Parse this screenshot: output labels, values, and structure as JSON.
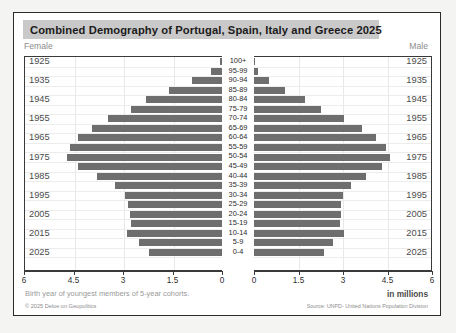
{
  "header": {
    "title": "Combined Demography of Portugal, Spain, Italy and Greece 2025",
    "female_label": "Female",
    "male_label": "Male"
  },
  "footer": {
    "note": "Birth year of youngest members of 5-year cohorts.",
    "units": "in millions",
    "copyright": "© 2025 Deloe on Geopolitics",
    "source": "Source: UNPD- United Nations Population Division"
  },
  "axis": {
    "left_ticks": [
      "6",
      "4.5",
      "3",
      "1.5",
      "0"
    ],
    "right_ticks": [
      "0",
      "1.5",
      "3",
      "4.5",
      "6"
    ],
    "max": 6
  },
  "chart_data": {
    "type": "bar",
    "title": "Combined Demography of Portugal, Spain, Italy and Greece 2025",
    "xlabel": "in millions",
    "ylabel": "",
    "xlim": [
      0,
      6
    ],
    "grid": true,
    "legend": [
      "Female",
      "Male"
    ],
    "categories": [
      "100+",
      "95-99",
      "90-94",
      "85-89",
      "80-84",
      "75-79",
      "70-74",
      "65-69",
      "60-64",
      "55-59",
      "50-54",
      "45-49",
      "40-44",
      "35-39",
      "30-34",
      "25-29",
      "20-24",
      "15-19",
      "10-14",
      "5-9",
      "0-4"
    ],
    "birth_years": [
      "1925",
      "",
      "1935",
      "",
      "1945",
      "",
      "1955",
      "",
      "1965",
      "",
      "1975",
      "",
      "1985",
      "",
      "1995",
      "",
      "2005",
      "",
      "2015",
      "",
      "2025"
    ],
    "series": [
      {
        "name": "Female",
        "values": [
          0.06,
          0.33,
          0.92,
          1.62,
          2.3,
          2.75,
          3.45,
          3.95,
          4.35,
          4.62,
          4.7,
          4.35,
          3.78,
          3.25,
          2.95,
          2.85,
          2.8,
          2.75,
          2.88,
          2.52,
          2.22
        ]
      },
      {
        "name": "Male",
        "values": [
          0.02,
          0.14,
          0.5,
          1.05,
          1.72,
          2.25,
          3.05,
          3.65,
          4.12,
          4.45,
          4.58,
          4.3,
          3.78,
          3.28,
          3.0,
          2.92,
          2.92,
          2.9,
          3.02,
          2.65,
          2.35
        ]
      }
    ]
  },
  "colors": {
    "bar": "#6e6e6e",
    "title_band": "#c9c9c9",
    "border": "#2b2b2b"
  }
}
